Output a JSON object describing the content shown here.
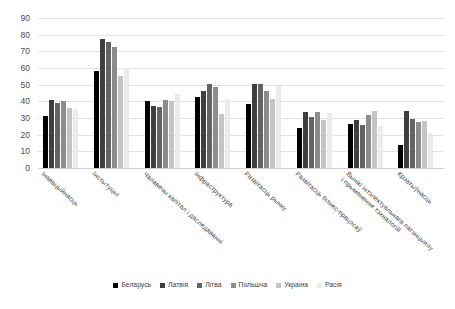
{
  "chart_data": {
    "type": "bar",
    "title": "",
    "xlabel": "",
    "ylabel": "",
    "ylim": [
      0,
      90
    ],
    "ytick_step": 10,
    "yticks": [
      90,
      80,
      70,
      60,
      50,
      40,
      30,
      20,
      10,
      0
    ],
    "grid": true,
    "legend_position": "bottom",
    "categories": [
      "Інавацыйнасць",
      "Інстытуцыі",
      "Чалавечы капітал і даследаванні",
      "Інфраструктура",
      "Развітасць рынку",
      "Развітасць бізнес-працэсаў",
      "Вынікі інтэлектуальнага патэнцыялу і прымяненне тэхналогій",
      "Крэатыўнасць"
    ],
    "series": [
      {
        "name": "Беларусь",
        "color": "#000000",
        "values": [
          31.3,
          58.2,
          40.4,
          42.8,
          38.6,
          24.0,
          26.7,
          13.6
        ]
      },
      {
        "name": "Латвія",
        "color": "#3f3f3f",
        "values": [
          41.0,
          77.6,
          37.2,
          46.2,
          50.6,
          33.4,
          28.6,
          34.5
        ]
      },
      {
        "name": "Літва",
        "color": "#646464",
        "values": [
          39.1,
          75.6,
          36.9,
          50.4,
          50.2,
          30.4,
          26.0,
          29.6
        ]
      },
      {
        "name": "Польшча",
        "color": "#8c8c8c",
        "values": [
          40.0,
          72.9,
          41.1,
          48.8,
          46.0,
          33.7,
          31.7,
          27.5
        ]
      },
      {
        "name": "Украіна",
        "color": "#c4c4c4",
        "values": [
          36.1,
          55.1,
          40.3,
          32.5,
          41.4,
          29.0,
          34.0,
          28.5
        ]
      },
      {
        "name": "Расія",
        "color": "#ebebeb",
        "values": [
          35.2,
          60.3,
          44.7,
          41.5,
          49.5,
          33.0,
          25.0,
          21.2
        ]
      }
    ]
  },
  "legend": {
    "items": [
      {
        "label": "Беларусь"
      },
      {
        "label": "Латвія"
      },
      {
        "label": "Літва"
      },
      {
        "label": "Польшча"
      },
      {
        "label": "Украіна"
      },
      {
        "label": "Расія"
      }
    ]
  }
}
